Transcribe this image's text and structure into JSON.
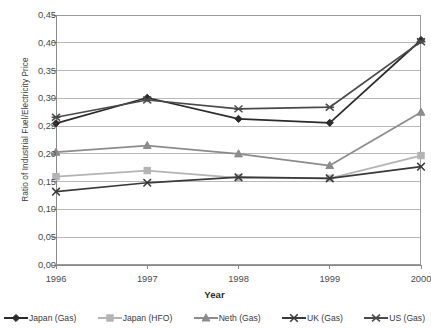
{
  "chart_data": {
    "type": "line",
    "title": "",
    "xlabel": "Year",
    "ylabel": "Ratio of Industrial Fuel/Electricity Price",
    "categories": [
      "1996",
      "1997",
      "1998",
      "1999",
      "2000"
    ],
    "x": [
      1996,
      1997,
      1998,
      1999,
      2000
    ],
    "ylim": [
      0.0,
      0.45
    ],
    "xlim": [
      1996,
      2000
    ],
    "ytick_labels": [
      "0,00",
      "0,05",
      "0,10",
      "0,15",
      "0,20",
      "0,25",
      "0,30",
      "0,35",
      "0,40",
      "0,45"
    ],
    "ytick_values": [
      0.0,
      0.05,
      0.1,
      0.15,
      0.2,
      0.25,
      0.3,
      0.35,
      0.4,
      0.45
    ],
    "grid": "horizontal",
    "legend_position": "bottom",
    "series": [
      {
        "name": "Japan (Gas)",
        "marker": "diamond",
        "color": "#2b2b2b",
        "values": [
          0.255,
          0.301,
          0.263,
          0.256,
          0.405
        ]
      },
      {
        "name": "Japan (HFO)",
        "marker": "square",
        "color": "#b4b4b4",
        "values": [
          0.159,
          0.17,
          0.157,
          0.156,
          0.197
        ]
      },
      {
        "name": "Neth (Gas)",
        "marker": "triangle",
        "color": "#8c8c8c",
        "values": [
          0.203,
          0.215,
          0.2,
          0.179,
          0.275
        ]
      },
      {
        "name": "UK (Gas)",
        "marker": "x",
        "color": "#3a3a3a",
        "values": [
          0.132,
          0.148,
          0.158,
          0.156,
          0.177
        ]
      },
      {
        "name": "US (Gas)",
        "marker": "asterisk",
        "color": "#4a4a4a",
        "values": [
          0.266,
          0.297,
          0.281,
          0.284,
          0.402
        ]
      }
    ]
  },
  "axis": {
    "y_title": "Ratio of Industrial Fuel/Electricity Price",
    "x_title": "Year"
  },
  "colors": {
    "plot_border": "#9a9a9a",
    "gridline": "#b9b9b9",
    "axis_text": "#4a4a4a",
    "background": "#ffffff"
  }
}
